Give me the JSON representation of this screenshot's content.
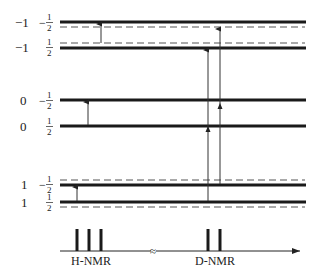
{
  "levels": [
    {
      "mI": "−1",
      "mS_sign": "−",
      "mS_num": "1",
      "mS_den": "2",
      "y": 22
    },
    {
      "mI": "−1",
      "mS_sign": "",
      "mS_num": "1",
      "mS_den": "2",
      "y": 48
    },
    {
      "mI": "0",
      "mS_sign": "−",
      "mS_num": "1",
      "mS_den": "2",
      "y": 100
    },
    {
      "mI": "0",
      "mS_sign": "",
      "mS_num": "1",
      "mS_den": "2",
      "y": 126
    },
    {
      "mI": "1",
      "mS_sign": "−",
      "mS_num": "1",
      "mS_den": "2",
      "y": 185
    },
    {
      "mI": "1",
      "mS_sign": "",
      "mS_num": "1",
      "mS_den": "2",
      "y": 202
    }
  ],
  "dashed_levels_y": [
    27,
    43,
    180,
    207
  ],
  "transitions": {
    "h_nmr": [
      {
        "x": 101,
        "from_y": 43,
        "to_y": 22
      },
      {
        "x": 88,
        "from_y": 126,
        "to_y": 100
      },
      {
        "x": 77,
        "from_y": 202,
        "to_y": 185
      }
    ],
    "d_nmr": [
      {
        "x": 208,
        "from_y": 202,
        "to_y": 48
      },
      {
        "x": 220,
        "from_y": 185,
        "to_y": 27
      }
    ]
  },
  "spectrum": {
    "h_label": "H-NMR",
    "d_label": "D-NMR",
    "break_symbol": "≈",
    "h_peaks_x": [
      77,
      88,
      101
    ],
    "d_peaks_x": [
      208,
      220
    ]
  },
  "colors": {
    "line": "#1a1a1a",
    "dashed": "#555555",
    "arrow": "#333333"
  }
}
